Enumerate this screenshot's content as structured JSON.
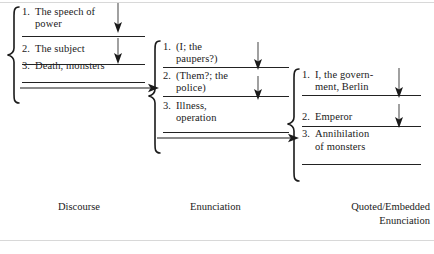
{
  "figure": {
    "type": "cascading-bracket-diagram",
    "columns": [
      {
        "id": "discourse",
        "caption": "Discourse",
        "items": [
          {
            "num": "1.",
            "text": "The speech of\npower"
          },
          {
            "num": "2.",
            "text": "The subject"
          },
          {
            "num": "3.",
            "text": "Death, monsters"
          }
        ]
      },
      {
        "id": "enunciation",
        "caption": "Enunciation",
        "items": [
          {
            "num": "1.",
            "text": "(I; the\n    paupers?)"
          },
          {
            "num": "2.",
            "text": "(Them?; the\n    police)"
          },
          {
            "num": "3.",
            "text": "Illness,\noperation"
          }
        ]
      },
      {
        "id": "quoted-embedded-enunciation",
        "caption": "Quoted/Embedded\nEnunciation",
        "items": [
          {
            "num": "1.",
            "text": "I, the govern-\nment, Berlin"
          },
          {
            "num": "2.",
            "text": "Emperor"
          },
          {
            "num": "3.",
            "text": "Annihilation\nof monsters"
          }
        ]
      }
    ],
    "arrows": {
      "vertical_label": "downward flow arrow",
      "horizontal_label": "rightward linking arrow"
    },
    "colors": {
      "ink": "#1a1a1a",
      "rule": "#222222",
      "page_rule": "#d8d8d8",
      "background": "#ffffff"
    }
  }
}
